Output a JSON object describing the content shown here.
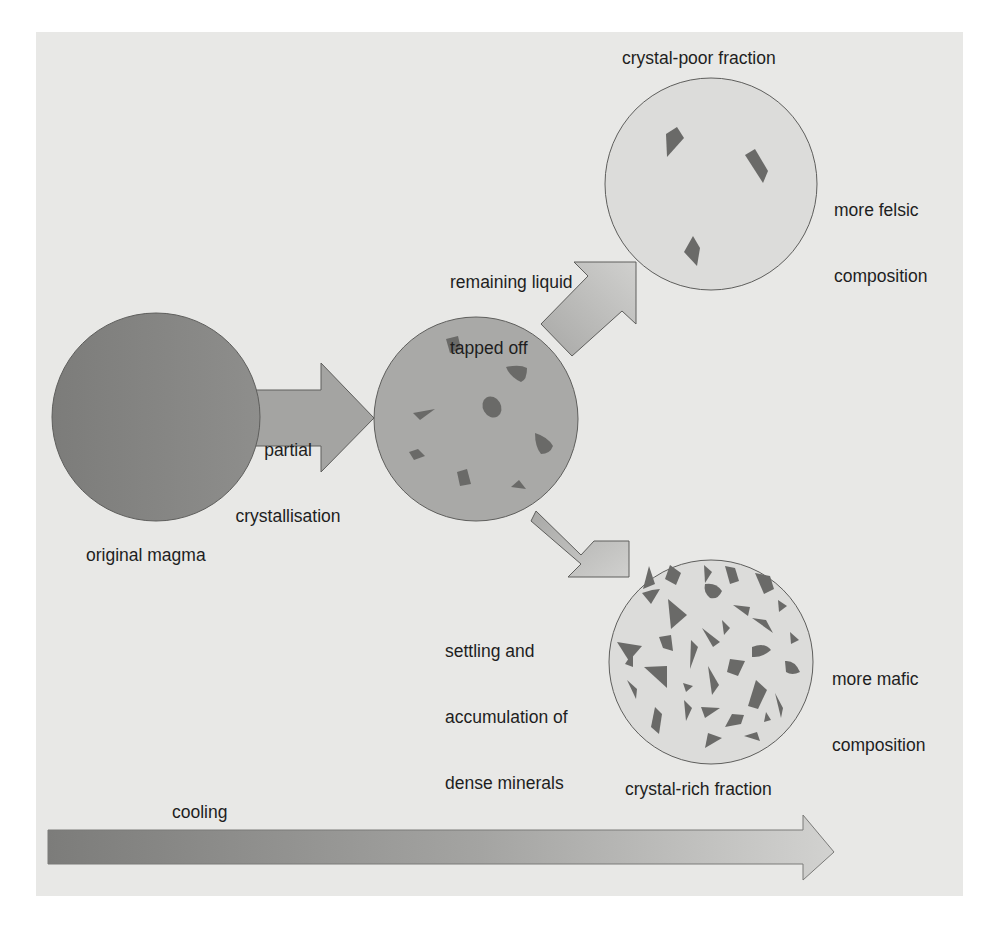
{
  "diagram": {
    "colors": {
      "panel_background": "#e8e8e6",
      "original_magma": "#8a8a88",
      "partially_crystallised_magma": "#a9a9a7",
      "fraction_circle": "#d8d8d6",
      "arrow_fill": "#b8b8b6",
      "crystal": "#6a6a68",
      "outline": "#5e5e5c",
      "text": "#1e1e1e"
    },
    "nodes": [
      {
        "id": "original-magma",
        "label": "original magma",
        "shading": "dark uniform"
      },
      {
        "id": "partially-crystallised",
        "label": "",
        "crystal_count": 8
      },
      {
        "id": "crystal-poor",
        "label": "crystal-poor fraction",
        "composition": "more felsic composition",
        "crystal_count": 3
      },
      {
        "id": "crystal-rich",
        "label": "crystal-rich fraction",
        "composition": "more mafic composition",
        "crystal_count": 34
      }
    ],
    "edges": [
      {
        "from": "original-magma",
        "to": "partially-crystallised",
        "label": "partial crystallisation"
      },
      {
        "from": "partially-crystallised",
        "to": "crystal-poor",
        "label": "remaining liquid tapped off"
      },
      {
        "from": "partially-crystallised",
        "to": "crystal-rich",
        "label": "settling and accumulation of dense minerals"
      }
    ]
  },
  "labels": {
    "crystal_poor_fraction": "crystal-poor fraction",
    "more_felsic_line1": "more felsic",
    "more_felsic_line2": "composition",
    "remaining_liquid_line1": "remaining liquid",
    "remaining_liquid_line2": "tapped off",
    "partial_line1": "partial",
    "partial_line2": "crystallisation",
    "original_magma": "original magma",
    "settling_line1": "settling and",
    "settling_line2": "accumulation of",
    "settling_line3": "dense minerals",
    "more_mafic_line1": "more mafic",
    "more_mafic_line2": "composition",
    "crystal_rich_fraction": "crystal-rich fraction",
    "cooling": "cooling"
  }
}
